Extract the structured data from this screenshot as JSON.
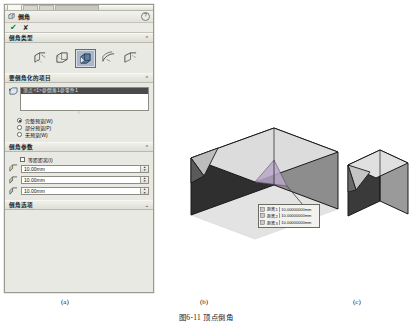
{
  "panel": {
    "title": "倒角",
    "help_label": "?",
    "accept_label": "✔",
    "cancel_label": "✘",
    "sections": [
      {
        "key": "type",
        "label": "倒角类型",
        "state": "expanded",
        "chevron": "⌃"
      },
      {
        "key": "items",
        "label": "要倒角化的项目",
        "state": "expanded",
        "chevron": "⌃"
      },
      {
        "key": "params",
        "label": "倒角参数",
        "state": "expanded",
        "chevron": "⌃"
      },
      {
        "key": "options",
        "label": "倒角选项",
        "state": "collapsed",
        "chevron": "⌄"
      }
    ],
    "chamfer_types": [
      {
        "name": "angle-distance-icon",
        "selected": false
      },
      {
        "name": "distance-distance-icon",
        "selected": false
      },
      {
        "name": "vertex-chamfer-icon",
        "selected": true
      },
      {
        "name": "offset-face-icon",
        "selected": false
      },
      {
        "name": "face-face-icon",
        "selected": false
      }
    ],
    "items": {
      "selection_icon": "vertex-pick-icon",
      "selected_entity": "顶点<1>@倒角1@零件1",
      "preview_options": [
        {
          "label": "完整预览(W)",
          "selected": true
        },
        {
          "label": "部分预览(P)",
          "selected": false
        },
        {
          "label": "无预览(W)",
          "selected": false
        }
      ]
    },
    "parameters": {
      "equal_distance": {
        "label": "等距距离(I)",
        "checked": false
      },
      "distances": [
        {
          "icon": "distance1-icon",
          "value": "10.00mm"
        },
        {
          "icon": "distance2-icon",
          "value": "10.00mm"
        },
        {
          "icon": "distance3-icon",
          "value": "10.00mm"
        }
      ]
    }
  },
  "callout": {
    "rows": [
      {
        "label": "距离 1",
        "value": "10.00000000mm"
      },
      {
        "label": "距离 2",
        "value": "10.00000000mm"
      },
      {
        "label": "距离 3",
        "value": "10.00000000mm"
      }
    ]
  },
  "figure": {
    "sub_a": "(a)",
    "sub_b": "(b)",
    "sub_c": "(c)",
    "title": "图6-11  顶点倒角"
  },
  "colors": {
    "panel_bg": "#e9e9e4",
    "selection_highlight": "#4a4a4a",
    "selected_tool": "#a9b7c9",
    "model_top": "#d9d9d9",
    "model_left": "#2e2e2e",
    "model_right": "#8a8a8a",
    "chamfer_face": "#5d5d5d"
  }
}
